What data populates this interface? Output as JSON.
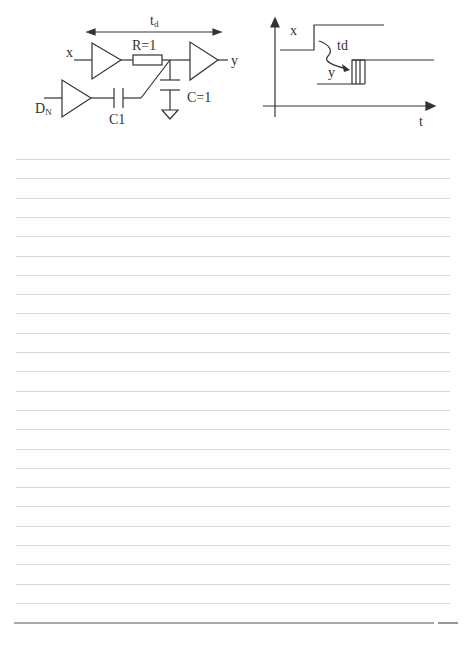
{
  "circuit": {
    "delay_label": "t",
    "delay_subscript": "d",
    "input_label": "x",
    "output_label": "y",
    "resistor_label": "R=1",
    "capacitor_label": "C=1",
    "coupling_cap_label": "C1",
    "noise_input_label": "D",
    "noise_input_subscript": "N"
  },
  "timing": {
    "x_signal_label": "x",
    "y_signal_label": "y",
    "delay_label": "td",
    "time_axis_label": "t"
  },
  "ruled_paper": {
    "line_count": 24,
    "first_line_y": 159,
    "line_pitch": 19.3,
    "line_x_start": 16,
    "line_x_end": 450,
    "line_color": "#d6d6d6",
    "bottom_rule_y": 623,
    "bottom_rule_color": "#555555"
  },
  "colors": {
    "ink": "#333333",
    "paper": "#ffffff"
  }
}
